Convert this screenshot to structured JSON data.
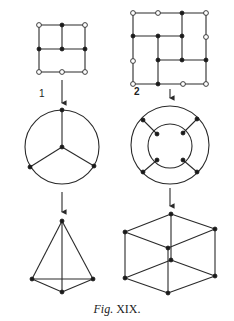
{
  "figure": {
    "caption_prefix": "Fig.",
    "caption_number": "XIX.",
    "panels": [
      {
        "id": "1",
        "label": "1",
        "description": "3x2 grid graph with open boundary nodes and filled interior/edge nodes, mapping to a circle with 3 radial spokes (K4 planar embedding), then to a tetrahedron"
      },
      {
        "id": "2",
        "label": "2",
        "description": "Square partitioned into rectangles with open and filled nodes, mapping to a double-ring graph with 4 spokes, then to a cube"
      }
    ]
  },
  "colors": {
    "stroke": "#2a2a2a",
    "node_filled": "#1a1a1a",
    "node_open": "#ffffff",
    "background": "#ffffff"
  }
}
